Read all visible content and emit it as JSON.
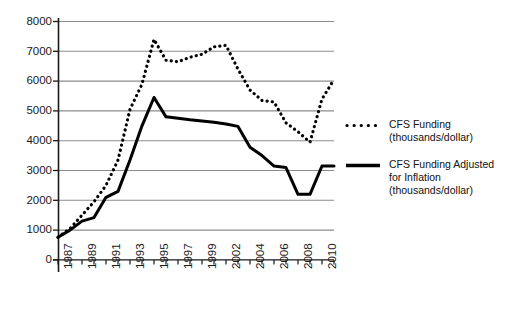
{
  "chart_data": {
    "type": "line",
    "title": "",
    "subtitle": "",
    "xlabel": "",
    "ylabel": "",
    "ylim": [
      0,
      8000
    ],
    "ytick_step": 1000,
    "yticks": [
      "0",
      "1000",
      "2000",
      "3000",
      "4000",
      "5000",
      "6000",
      "7000",
      "8000"
    ],
    "grid": "horizontal",
    "legend_position": "right",
    "x": [
      1987,
      1988,
      1989,
      1990,
      1991,
      1992,
      1993,
      1994,
      1995,
      1996,
      1997,
      1998,
      1999,
      2000,
      2001,
      2002,
      2003,
      2004,
      2005,
      2006,
      2007,
      2008,
      2009,
      2010
    ],
    "xtick_labels": [
      "1987",
      "",
      "1989",
      "",
      "1991",
      "",
      "1993",
      "",
      "1995",
      "",
      "1997",
      "",
      "1999",
      "",
      "2002",
      "",
      "2004",
      "",
      "2006",
      "",
      "2008",
      "",
      "2010",
      ""
    ],
    "xtick_labels_visible": [
      "1987",
      "1989",
      "1991",
      "1993",
      "1995",
      "1997",
      "1999",
      "2002",
      "2004",
      "2006",
      "2008",
      "2010"
    ],
    "series": [
      {
        "name": "CFS Funding (thousands/dollar)",
        "style": "dotted",
        "color": "#000000",
        "values": [
          760,
          1050,
          1500,
          1950,
          2500,
          3350,
          5050,
          5900,
          7400,
          6700,
          6650,
          6800,
          6900,
          7150,
          7200,
          6400,
          5700,
          5350,
          5300,
          4600,
          4300,
          3950,
          5400,
          6050
        ]
      },
      {
        "name": "CFS Funding Adjusted for Inflation (thousands/dollar)",
        "style": "solid",
        "color": "#000000",
        "values": [
          760,
          1000,
          1300,
          1420,
          2100,
          2300,
          3350,
          4500,
          5450,
          4800,
          4750,
          4700,
          4660,
          4620,
          4560,
          4480,
          3780,
          3500,
          3150,
          3100,
          2200,
          2200,
          3150,
          3150
        ]
      }
    ]
  },
  "legend": {
    "entries": [
      {
        "swatch": "dotted-line-swatch",
        "line1": "CFS Funding",
        "line2": "(thousands/dollar)",
        "line3": ""
      },
      {
        "swatch": "solid-line-swatch",
        "line1": "CFS Funding Adjusted",
        "line2": "for Inflation",
        "line3": "(thousands/dollar)"
      }
    ]
  },
  "colors": {
    "axis": "#000000",
    "gridline": "#8c8c8c",
    "series": "#000000",
    "background": "#ffffff",
    "text": "#1a1a1a"
  }
}
